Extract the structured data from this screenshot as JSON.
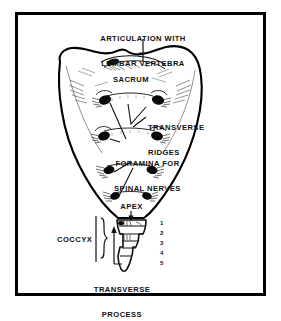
{
  "figure": {
    "frame_color": "#000000",
    "background_color": "#ffffff",
    "ink_color": "#111111"
  },
  "labels": {
    "articulation": {
      "line1": "ARTICULATION WITH",
      "line2": "LUMBAR VERTEBRA"
    },
    "sacrum": "SACRUM",
    "transverse_ridges": {
      "line1": "TRANSVERSE",
      "line2": "RIDGES"
    },
    "foramina": {
      "line1": "FORAMINA FOR",
      "line2": "SPINAL NERVES"
    },
    "apex": "APEX",
    "coccyx": "COCCYX",
    "transverse_process": {
      "line1": "TRANSVERSE",
      "line2": "PROCESS"
    }
  },
  "coccyx_segments": [
    "1",
    "2",
    "3",
    "4",
    "5"
  ]
}
